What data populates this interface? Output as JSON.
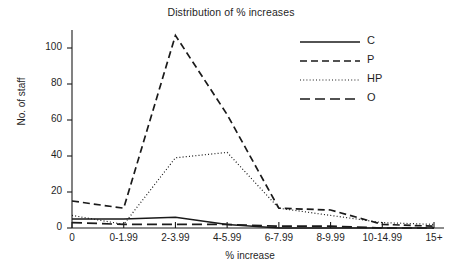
{
  "chart_data": {
    "type": "line",
    "title": "Distribution of % increases",
    "xlabel": "% increase",
    "ylabel": "No. of staff",
    "categories": [
      "0",
      "0-1.99",
      "2-3.99",
      "4-5.99",
      "6-7.99",
      "8-9.99",
      "10-14.99",
      "15+"
    ],
    "yticks": [
      0,
      20,
      40,
      60,
      80,
      100
    ],
    "ylim": [
      0,
      110
    ],
    "grid": false,
    "legend_position": "top-right",
    "series": [
      {
        "name": "C",
        "style": "solid",
        "values": [
          5,
          5,
          6,
          2,
          0,
          0,
          0,
          0
        ]
      },
      {
        "name": "P",
        "style": "dashed",
        "values": [
          15,
          11,
          107,
          63,
          11,
          10,
          2,
          1
        ]
      },
      {
        "name": "HP",
        "style": "dotted",
        "values": [
          7,
          2,
          39,
          42,
          11,
          7,
          3,
          2
        ]
      },
      {
        "name": "O",
        "style": "long-dashed",
        "values": [
          3,
          2,
          2,
          2,
          1,
          1,
          0,
          0
        ]
      }
    ]
  },
  "legend": {
    "entries": [
      {
        "label": "C"
      },
      {
        "label": "P"
      },
      {
        "label": "HP"
      },
      {
        "label": "O"
      }
    ]
  }
}
